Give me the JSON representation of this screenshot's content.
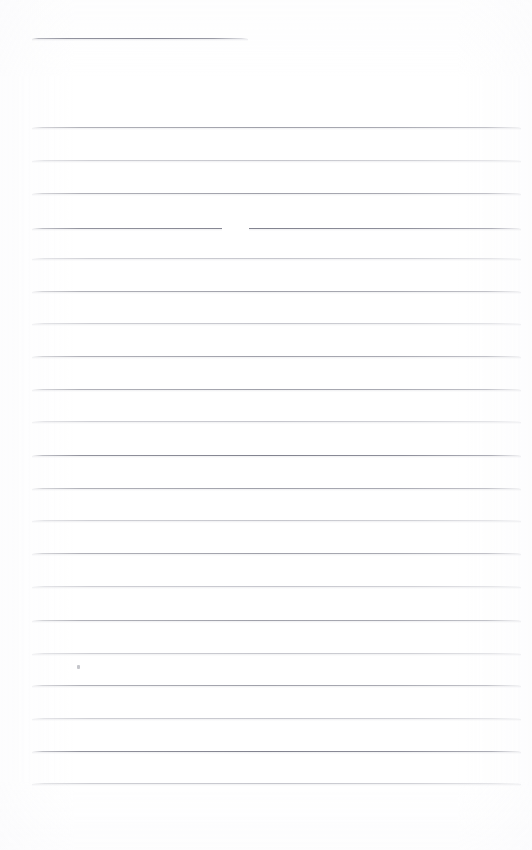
{
  "document": {
    "kind": "scanned-lined-notebook-page",
    "title": "Blank ruled page",
    "content_text": "",
    "page_width": 532,
    "page_height": 850,
    "background_color": "#ffffff",
    "rule_color": "#96979f",
    "rule_color_faint": "#b4b5bd",
    "rule_color_strong": "#82838f"
  },
  "header_rule": {
    "label": "header rule",
    "x_start": 32,
    "x_end": 248,
    "y": 38,
    "weight": "strong"
  },
  "ruling": {
    "label": "ruled writing lines",
    "count": 21,
    "x_start": 32,
    "x_end": 521,
    "first_y": 127,
    "spacing": 32.8,
    "lines": [
      {
        "y": 127,
        "weight": "normal"
      },
      {
        "y": 160,
        "weight": "faint"
      },
      {
        "y": 193,
        "weight": "normal"
      },
      {
        "y": 228,
        "weight": "strong"
      },
      {
        "y": 258,
        "weight": "faint"
      },
      {
        "y": 291,
        "weight": "normal"
      },
      {
        "y": 323,
        "weight": "faint"
      },
      {
        "y": 356,
        "weight": "normal"
      },
      {
        "y": 389,
        "weight": "normal"
      },
      {
        "y": 421,
        "weight": "faint"
      },
      {
        "y": 455,
        "weight": "strong"
      },
      {
        "y": 488,
        "weight": "normal"
      },
      {
        "y": 520,
        "weight": "faint"
      },
      {
        "y": 553,
        "weight": "normal"
      },
      {
        "y": 586,
        "weight": "faint"
      },
      {
        "y": 620,
        "weight": "normal"
      },
      {
        "y": 653,
        "weight": "faint"
      },
      {
        "y": 685,
        "weight": "normal"
      },
      {
        "y": 718,
        "weight": "faint"
      },
      {
        "y": 751,
        "weight": "strong"
      },
      {
        "y": 783,
        "weight": "faint"
      }
    ]
  },
  "artifacts": {
    "line_gap": {
      "label": "dropout in ruled line",
      "on_line_y": 228,
      "x_start": 222,
      "x_end": 249
    },
    "stray_dot": {
      "label": "faint pencil dot",
      "x": 77,
      "y": 665
    }
  },
  "margins": {
    "left": 32,
    "right": 11,
    "top": 38,
    "bottom": 67
  }
}
